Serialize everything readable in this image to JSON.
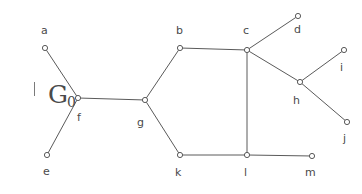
{
  "figure": {
    "caption_main": "G",
    "caption_subscript": "0",
    "width": 362,
    "height": 194,
    "background_color": "#ffffff",
    "stroke_color": "#5a5a5a",
    "label_color": "#4a4a4a"
  },
  "chart_data": {
    "type": "diagram",
    "title": "G0",
    "graph_kind": "undirected-graph",
    "node_count": 13,
    "edge_count": 13,
    "nodes": [
      {
        "id": "a",
        "label": "a",
        "x": 45,
        "y": 48,
        "label_x": 41,
        "label_y": 25,
        "degree": 1
      },
      {
        "id": "b",
        "label": "b",
        "x": 180,
        "y": 48,
        "label_x": 176,
        "label_y": 25,
        "degree": 2
      },
      {
        "id": "c",
        "label": "c",
        "x": 247,
        "y": 50,
        "label_x": 243,
        "label_y": 25,
        "degree": 4
      },
      {
        "id": "d",
        "label": "d",
        "x": 298,
        "y": 16,
        "label_x": 294,
        "label_y": 24,
        "degree": 1
      },
      {
        "id": "e",
        "label": "e",
        "x": 47,
        "y": 155,
        "label_x": 43,
        "label_y": 166,
        "degree": 1
      },
      {
        "id": "f",
        "label": "f",
        "x": 78,
        "y": 98,
        "label_x": 77,
        "label_y": 112,
        "degree": 3
      },
      {
        "id": "g",
        "label": "g",
        "x": 145,
        "y": 100,
        "label_x": 137,
        "label_y": 117,
        "degree": 3
      },
      {
        "id": "h",
        "label": "h",
        "x": 300,
        "y": 82,
        "label_x": 293,
        "label_y": 95,
        "degree": 3
      },
      {
        "id": "i",
        "label": "i",
        "x": 344,
        "y": 50,
        "label_x": 340,
        "label_y": 62,
        "degree": 1
      },
      {
        "id": "j",
        "label": "j",
        "x": 347,
        "y": 122,
        "label_x": 343,
        "label_y": 133,
        "degree": 1
      },
      {
        "id": "k",
        "label": "k",
        "x": 180,
        "y": 155,
        "label_x": 175,
        "label_y": 167,
        "degree": 2
      },
      {
        "id": "l",
        "label": "l",
        "x": 247,
        "y": 155,
        "label_x": 244,
        "label_y": 167,
        "degree": 3
      },
      {
        "id": "m",
        "label": "m",
        "x": 312,
        "y": 156,
        "label_x": 305,
        "label_y": 167,
        "degree": 1
      }
    ],
    "edges": [
      {
        "source": "a",
        "target": "f"
      },
      {
        "source": "e",
        "target": "f"
      },
      {
        "source": "f",
        "target": "g"
      },
      {
        "source": "g",
        "target": "b"
      },
      {
        "source": "g",
        "target": "k"
      },
      {
        "source": "b",
        "target": "c"
      },
      {
        "source": "c",
        "target": "d"
      },
      {
        "source": "c",
        "target": "h"
      },
      {
        "source": "c",
        "target": "l"
      },
      {
        "source": "h",
        "target": "i"
      },
      {
        "source": "h",
        "target": "j"
      },
      {
        "source": "k",
        "target": "l"
      },
      {
        "source": "l",
        "target": "m"
      }
    ]
  }
}
